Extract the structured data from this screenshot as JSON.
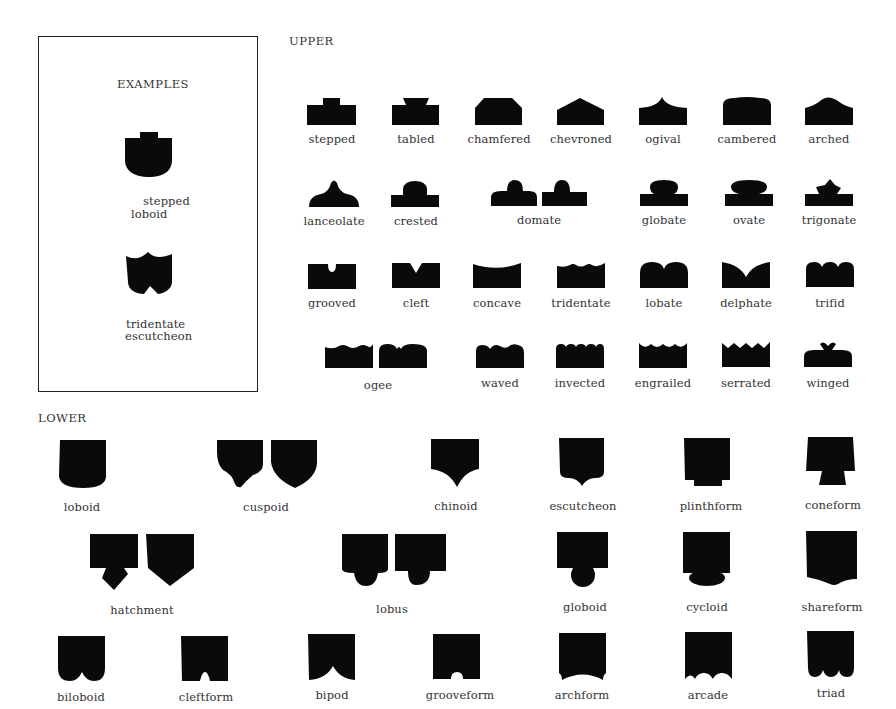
{
  "examples": {
    "title": "EXAMPLES",
    "items": [
      {
        "line1": "stepped",
        "line2": "loboid"
      },
      {
        "line1": "tridentate",
        "line2": "escutcheon"
      }
    ]
  },
  "upper": {
    "heading": "UPPER",
    "rows": [
      [
        "stepped",
        "tabled",
        "chamfered",
        "chevroned",
        "ogival",
        "cambered",
        "arched"
      ],
      [
        "lanceolate",
        "crested",
        "domate",
        "globate",
        "ovate",
        "trigonate"
      ],
      [
        "grooved",
        "cleft",
        "concave",
        "tridentate",
        "lobate",
        "delphate",
        "trifid"
      ],
      [
        "ogee",
        "waved",
        "invected",
        "engrailed",
        "serrated",
        "winged"
      ]
    ]
  },
  "lower": {
    "heading": "LOWER",
    "rows": [
      [
        "loboid",
        "cuspoid",
        "chinoid",
        "escutcheon",
        "plinthform",
        "coneform"
      ],
      [
        "hatchment",
        "lobus",
        "globoid",
        "cycloid",
        "shareform"
      ],
      [
        "biloboid",
        "cleftform",
        "bipod",
        "grooveform",
        "archform",
        "arcade",
        "triad"
      ]
    ]
  },
  "colors": {
    "ink": "#0a0a0a",
    "background": "#ffffff",
    "text": "#333333"
  }
}
